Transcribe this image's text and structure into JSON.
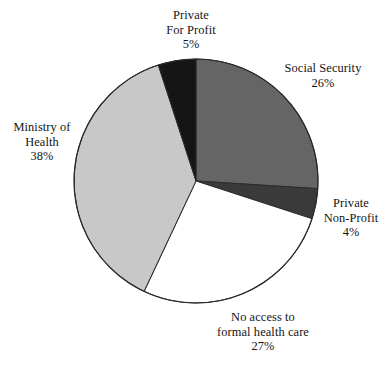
{
  "chart_data": {
    "type": "pie",
    "title": "",
    "subtitle": "",
    "xlabel": "",
    "ylabel": "",
    "legend_position": "none",
    "grid": false,
    "labels_outside": true,
    "start_angle_deg": 0,
    "direction": "clockwise",
    "categories": [
      "Social Security",
      "Private Non-Profit",
      "No access to formal health care",
      "Ministry of Health",
      "Private For Profit"
    ],
    "values": [
      26,
      4,
      27,
      38,
      5
    ],
    "units": "%",
    "slices": [
      {
        "name": "Social Security",
        "value": 26,
        "value_text": "26%",
        "color": "#656565",
        "start_deg": 0,
        "end_deg": 93.6
      },
      {
        "name": "Private Non-Profit",
        "value": 4,
        "value_text": "4%",
        "color": "#3a3a3a",
        "start_deg": 93.6,
        "end_deg": 108.0
      },
      {
        "name": "No access to formal health care",
        "value": 27,
        "value_text": "27%",
        "color": "#ffffff",
        "start_deg": 108.0,
        "end_deg": 205.2
      },
      {
        "name": "Ministry of Health",
        "value": 38,
        "value_text": "38%",
        "color": "#c8c8c8",
        "start_deg": 205.2,
        "end_deg": 342.0
      },
      {
        "name": "Private For Profit",
        "value": 5,
        "value_text": "5%",
        "color": "#151515",
        "start_deg": 342.0,
        "end_deg": 360.0
      }
    ]
  },
  "labels": {
    "private_for_profit": {
      "line1": "Private",
      "line2": "For Profit",
      "value": "5%"
    },
    "social_security": {
      "line1": "Social Security",
      "value": "26%"
    },
    "private_non_profit": {
      "line1": "Private",
      "line2": "Non-Profit",
      "value": "4%"
    },
    "ministry_of_health": {
      "line1": "Ministry of",
      "line2": "Health",
      "value": "38%"
    },
    "no_access": {
      "line1": "No access to",
      "line2": "formal health care",
      "value": "27%"
    }
  },
  "style": {
    "outline_color": "#2b2b2b",
    "background": "#ffffff"
  }
}
